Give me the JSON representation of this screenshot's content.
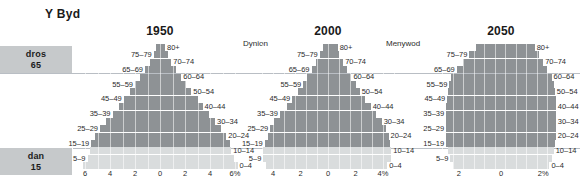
{
  "page_title": "Y Byd",
  "side_boxes": [
    {
      "name": "over-65",
      "line1": "dros",
      "line2": "65"
    },
    {
      "name": "under-15",
      "line1": "dan",
      "line2": "15"
    }
  ],
  "gender_labels": {
    "left": "Dynion",
    "right": "Menywod"
  },
  "age_groups": [
    "80+",
    "75–79",
    "70–74",
    "65–69",
    "60–64",
    "55–59",
    "50–54",
    "45–49",
    "40–44",
    "35–39",
    "30–34",
    "25–29",
    "20–24",
    "15–19",
    "10–14",
    "5–9",
    "0–4"
  ],
  "chart_data": [
    {
      "type": "bar",
      "name": "pyramid-1950",
      "title": "1950",
      "xlabel": "",
      "ylabel": "",
      "xlim": [
        -6,
        6
      ],
      "tick_labels": [
        "6",
        "4",
        "2",
        "0",
        "2",
        "4",
        "6%"
      ],
      "tick_values": [
        -6,
        -4,
        -2,
        0,
        2,
        4,
        6
      ],
      "categories": [
        "80+",
        "75–79",
        "70–74",
        "65–69",
        "60–64",
        "55–59",
        "50–54",
        "45–49",
        "40–44",
        "35–39",
        "30–34",
        "25–29",
        "20–24",
        "15–19",
        "10–14",
        "5–9",
        "0–4"
      ],
      "series": [
        {
          "name": "Dynion",
          "side": "left",
          "values": [
            0.3,
            0.5,
            0.8,
            1.2,
            1.6,
            2.0,
            2.4,
            2.9,
            3.3,
            3.8,
            4.3,
            4.8,
            5.2,
            5.5,
            5.6,
            5.8,
            6.2
          ]
        },
        {
          "name": "Menywod",
          "side": "right",
          "values": [
            0.4,
            0.6,
            0.9,
            1.3,
            1.7,
            2.1,
            2.5,
            3.0,
            3.4,
            3.9,
            4.4,
            4.9,
            5.3,
            5.6,
            5.7,
            5.9,
            6.2
          ]
        }
      ],
      "legend_position": "top",
      "grid": true
    },
    {
      "type": "bar",
      "name": "pyramid-2000",
      "title": "2000",
      "xlabel": "",
      "ylabel": "",
      "xlim": [
        -4.8,
        4.8
      ],
      "tick_labels": [
        "4",
        "2",
        "0",
        "2",
        "4%"
      ],
      "tick_values": [
        -4,
        -2,
        0,
        2,
        4
      ],
      "categories": [
        "80+",
        "75–79",
        "70–74",
        "65–69",
        "60–64",
        "55–59",
        "50–54",
        "45–49",
        "40–44",
        "35–39",
        "30–34",
        "25–29",
        "20–24",
        "15–19",
        "10–14",
        "5–9",
        "0–4"
      ],
      "series": [
        {
          "name": "Dynion",
          "side": "left",
          "values": [
            0.4,
            0.6,
            0.9,
            1.2,
            1.5,
            1.8,
            2.2,
            2.6,
            3.0,
            3.5,
            3.9,
            4.2,
            4.4,
            4.6,
            4.7,
            4.7,
            4.5
          ]
        },
        {
          "name": "Menywod",
          "side": "right",
          "values": [
            0.7,
            0.8,
            1.1,
            1.4,
            1.7,
            2.0,
            2.3,
            2.7,
            3.1,
            3.5,
            3.9,
            4.2,
            4.4,
            4.5,
            4.6,
            4.6,
            4.3
          ]
        }
      ],
      "legend_position": "top",
      "grid": true
    },
    {
      "type": "bar",
      "name": "pyramid-2050",
      "title": "2050",
      "xlabel": "",
      "ylabel": "",
      "xlim": [
        -2.8,
        2.8
      ],
      "tick_labels": [
        "2",
        "0",
        "2%"
      ],
      "tick_values": [
        -2,
        0,
        2
      ],
      "categories": [
        "80+",
        "75–79",
        "70–74",
        "65–69",
        "60–64",
        "55–59",
        "50–54",
        "45–49",
        "40–44",
        "35–39",
        "30–34",
        "25–29",
        "20–24",
        "15–19",
        "10–14",
        "5–9",
        "0–4"
      ],
      "series": [
        {
          "name": "Dynion",
          "side": "left",
          "values": [
            1.2,
            1.5,
            1.8,
            2.1,
            2.35,
            2.45,
            2.5,
            2.55,
            2.6,
            2.6,
            2.6,
            2.6,
            2.6,
            2.6,
            2.5,
            2.4,
            2.3
          ]
        },
        {
          "name": "Menywod",
          "side": "right",
          "values": [
            1.6,
            1.8,
            2.0,
            2.2,
            2.4,
            2.5,
            2.55,
            2.6,
            2.6,
            2.6,
            2.6,
            2.6,
            2.6,
            2.55,
            2.5,
            2.4,
            2.3
          ]
        }
      ],
      "legend_position": "top",
      "grid": true
    }
  ],
  "colors": {
    "bar_dark": "#8e9295",
    "bar_light": "#d9dcdd",
    "sidebox": "#c6c9cb",
    "refline": "#b9bec4"
  }
}
